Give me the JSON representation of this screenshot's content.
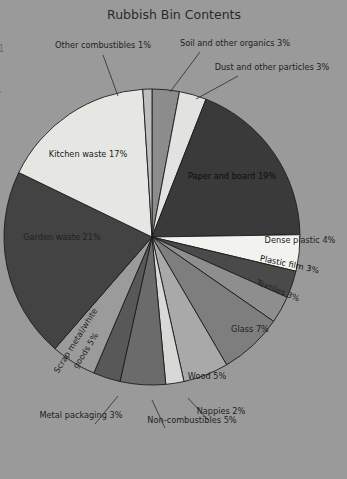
{
  "chart_data": {
    "type": "pie",
    "title": "Rubbish Bin Contents",
    "xlabel": "",
    "ylabel": "",
    "legend_position": "none",
    "grid": false,
    "unit": "%",
    "categories": [
      "Soil and other organics",
      "Dust and other particles",
      "Paper and board",
      "Dense plastic",
      "Plastic film",
      "Textiles",
      "Glass",
      "Wood",
      "Nappies",
      "Non-combustibles",
      "Metal packaging",
      "Scrap metal/white goods",
      "Garden waste",
      "Kitchen waste",
      "Other combustibles"
    ],
    "values": [
      3,
      3,
      19,
      4,
      3,
      3,
      7,
      5,
      2,
      5,
      3,
      5,
      21,
      17,
      1
    ],
    "labels": [
      "Soil and other organics 3%",
      "Dust and other particles 3%",
      "Paper and board 19%",
      "Dense plastic 4%",
      "Plastic film 3%",
      "Textiles 3%",
      "Glass 7%",
      "Wood 5%",
      "Nappies 2%",
      "Non-combustibles 5%",
      "Metal packaging 3%",
      "Scrap metal/white goods 5%",
      "Garden waste 21%",
      "Kitchen waste 17%",
      "Other combustibles 1%"
    ],
    "colors": [
      "#8c8c8c",
      "#e2e2e0",
      "#3a3a3a",
      "#f2f2ef",
      "#4a4a4a",
      "#8e8e8e",
      "#7e7e7e",
      "#a9a9a9",
      "#d8d8d6",
      "#6b6b6b",
      "#585858",
      "#9b9b9b",
      "#434343",
      "#e6e6e3",
      "#bdbdbd"
    ],
    "start_angle_deg": 0,
    "direction": "clockwise"
  },
  "edge_marks": {
    "top": "1",
    "bottom": "."
  }
}
